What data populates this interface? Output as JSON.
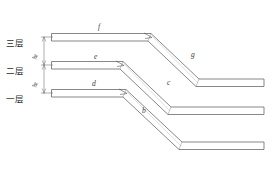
{
  "diagram": {
    "stroke_color": "#555555",
    "fill_color": "#ffffff",
    "floor_labels": [
      {
        "id": "floor-3",
        "text": "三层",
        "x": 6,
        "y": 36
      },
      {
        "id": "floor-2",
        "text": "二层",
        "x": 6,
        "y": 64
      },
      {
        "id": "floor-1",
        "text": "一层",
        "x": 6,
        "y": 92
      }
    ],
    "dimension_labels": [
      {
        "id": "dim-h-upper",
        "text": "h",
        "x": 34,
        "y": 55
      },
      {
        "id": "dim-h-lower",
        "text": "h",
        "x": 34,
        "y": 83
      }
    ],
    "segment_labels": [
      {
        "id": "seg-f",
        "text": "f",
        "x": 98,
        "y": 26
      },
      {
        "id": "seg-e-mid",
        "text": "e",
        "x": 94,
        "y": 59
      },
      {
        "id": "seg-d",
        "text": "d",
        "x": 92,
        "y": 85
      },
      {
        "id": "seg-g",
        "text": "g",
        "x": 191,
        "y": 55
      },
      {
        "id": "seg-c",
        "text": "c",
        "x": 167,
        "y": 83
      },
      {
        "id": "seg-b",
        "text": "b",
        "x": 142,
        "y": 110
      }
    ],
    "beams": {
      "top": {
        "label": "f",
        "floor": "三层"
      },
      "middle": {
        "label": "e",
        "floor": "二层"
      },
      "bottom": {
        "label": "d",
        "floor": "一层"
      }
    },
    "diagonals": [
      {
        "label": "g",
        "from_floor": "三层"
      },
      {
        "label": "c",
        "from_floor": "二层"
      },
      {
        "label": "b",
        "from_floor": "一层"
      }
    ]
  }
}
